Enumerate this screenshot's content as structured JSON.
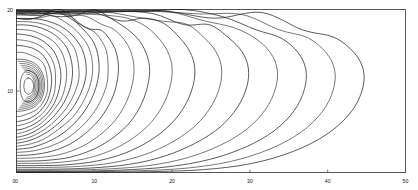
{
  "figure": {
    "title": "",
    "background_color": "#ffffff",
    "line_color": "#1c1c1c",
    "frame_color": "#4d4d4d"
  },
  "axes": {
    "x": {
      "label": "",
      "min": 0,
      "max": 50,
      "ticks": [
        0,
        10,
        20,
        30,
        40,
        50
      ],
      "tick_labels": [
        "0",
        "10",
        "20",
        "30",
        "40",
        "50"
      ]
    },
    "y": {
      "label": "",
      "min": 0,
      "max": 20,
      "ticks": [
        0,
        10,
        20
      ],
      "tick_labels": [
        "0",
        "10",
        "20"
      ]
    }
  },
  "chart_data": {
    "type": "line",
    "subtype": "contour",
    "title": "",
    "xlabel": "",
    "ylabel": "",
    "xlim": [
      0,
      50
    ],
    "ylim": [
      0,
      20
    ],
    "grid": false,
    "legend": "none",
    "n_levels": 14,
    "level_labels": [
      "1",
      "2",
      "3",
      "4",
      "5",
      "6",
      "7",
      "8",
      "9",
      "10",
      "11",
      "12",
      "13",
      "14"
    ],
    "core_center": {
      "x": 1.8,
      "y": 10.6
    },
    "series": [
      {
        "name": "level-1",
        "closed": true,
        "points": [
          [
            1.5,
            11.6
          ],
          [
            2.0,
            11.3
          ],
          [
            2.2,
            10.6
          ],
          [
            2.0,
            9.9
          ],
          [
            1.5,
            9.6
          ],
          [
            1.1,
            9.9
          ],
          [
            0.95,
            10.6
          ],
          [
            1.1,
            11.3
          ],
          [
            1.5,
            11.6
          ]
        ]
      },
      {
        "name": "level-2",
        "closed": true,
        "points": [
          [
            1.6,
            12.5
          ],
          [
            2.5,
            12.0
          ],
          [
            2.9,
            10.8
          ],
          [
            2.6,
            9.4
          ],
          [
            1.8,
            8.7
          ],
          [
            0.9,
            8.9
          ],
          [
            0.5,
            10.0
          ],
          [
            0.55,
            11.4
          ],
          [
            1.0,
            12.3
          ],
          [
            1.6,
            12.5
          ]
        ]
      },
      {
        "name": "level-3",
        "open_left": true,
        "points": [
          [
            0,
            13.9
          ],
          [
            1.3,
            13.8
          ],
          [
            2.6,
            13.2
          ],
          [
            3.4,
            12.0
          ],
          [
            3.6,
            10.5
          ],
          [
            3.2,
            9.0
          ],
          [
            2.2,
            8.0
          ],
          [
            1.0,
            7.6
          ],
          [
            0,
            7.5
          ]
        ]
      },
      {
        "name": "level-4",
        "open_left": true,
        "points": [
          [
            0,
            15.6
          ],
          [
            1.0,
            15.5
          ],
          [
            2.2,
            15.2
          ],
          [
            3.3,
            14.5
          ],
          [
            4.1,
            13.3
          ],
          [
            4.5,
            11.8
          ],
          [
            4.4,
            10.2
          ],
          [
            3.9,
            8.7
          ],
          [
            2.9,
            7.4
          ],
          [
            1.6,
            6.6
          ],
          [
            0.4,
            6.3
          ],
          [
            0,
            6.25
          ]
        ]
      },
      {
        "name": "level-5",
        "open_left": true,
        "points": [
          [
            0,
            17.0
          ],
          [
            1.1,
            16.9
          ],
          [
            2.4,
            16.6
          ],
          [
            3.6,
            16.0
          ],
          [
            4.7,
            15.0
          ],
          [
            5.4,
            13.6
          ],
          [
            5.7,
            12.0
          ],
          [
            5.5,
            10.3
          ],
          [
            4.9,
            8.6
          ],
          [
            3.8,
            7.1
          ],
          [
            2.4,
            6.0
          ],
          [
            1.0,
            5.4
          ],
          [
            0,
            5.2
          ]
        ]
      },
      {
        "name": "level-6",
        "open_left": true,
        "points": [
          [
            0,
            18.1
          ],
          [
            1.2,
            18.1
          ],
          [
            2.6,
            17.9
          ],
          [
            4.0,
            17.4
          ],
          [
            5.3,
            16.6
          ],
          [
            6.4,
            15.4
          ],
          [
            7.0,
            13.9
          ],
          [
            7.2,
            12.2
          ],
          [
            6.9,
            10.4
          ],
          [
            6.1,
            8.6
          ],
          [
            4.9,
            7.0
          ],
          [
            3.4,
            5.7
          ],
          [
            1.8,
            4.8
          ],
          [
            0.5,
            4.4
          ],
          [
            0,
            4.35
          ]
        ]
      },
      {
        "name": "level-7",
        "open_left": true,
        "points": [
          [
            0,
            18.9
          ],
          [
            1.4,
            18.9
          ],
          [
            3.0,
            18.8
          ],
          [
            4.6,
            18.4
          ],
          [
            6.1,
            17.7
          ],
          [
            7.4,
            16.6
          ],
          [
            8.4,
            15.2
          ],
          [
            8.9,
            13.5
          ],
          [
            8.9,
            11.7
          ],
          [
            8.3,
            9.8
          ],
          [
            7.2,
            7.9
          ],
          [
            5.7,
            6.3
          ],
          [
            4.0,
            5.0
          ],
          [
            2.2,
            4.1
          ],
          [
            0.7,
            3.7
          ],
          [
            0,
            3.6
          ]
        ]
      },
      {
        "name": "level-8",
        "open_left": true,
        "wavy_top": true,
        "points": [
          [
            0,
            19.4
          ],
          [
            1.6,
            19.4
          ],
          [
            3.3,
            19.4
          ],
          [
            5.0,
            19.2
          ],
          [
            6.5,
            18.8
          ],
          [
            7.9,
            18.1
          ],
          [
            9.1,
            17.1
          ],
          [
            10.0,
            15.8
          ],
          [
            10.5,
            14.2
          ],
          [
            10.6,
            12.4
          ],
          [
            10.2,
            10.4
          ],
          [
            9.3,
            8.4
          ],
          [
            7.9,
            6.5
          ],
          [
            6.1,
            4.9
          ],
          [
            4.1,
            3.8
          ],
          [
            2.1,
            3.1
          ],
          [
            0.6,
            2.9
          ],
          [
            0,
            2.85
          ]
        ]
      },
      {
        "name": "level-9",
        "open_left": true,
        "wavy_top": true,
        "points": [
          [
            0,
            19.6
          ],
          [
            2.0,
            19.65
          ],
          [
            4.0,
            19.6
          ],
          [
            6.0,
            19.4
          ],
          [
            7.8,
            19.0
          ],
          [
            9.4,
            18.4
          ],
          [
            10.9,
            17.5
          ],
          [
            12.0,
            16.3
          ],
          [
            12.8,
            14.8
          ],
          [
            13.1,
            13.0
          ],
          [
            12.9,
            11.0
          ],
          [
            12.2,
            8.9
          ],
          [
            10.9,
            6.8
          ],
          [
            9.1,
            5.0
          ],
          [
            6.9,
            3.5
          ],
          [
            4.5,
            2.6
          ],
          [
            2.2,
            2.2
          ],
          [
            0.5,
            2.1
          ],
          [
            0,
            2.1
          ]
        ]
      },
      {
        "name": "level-10",
        "open_left": true,
        "wavy_top": true,
        "points": [
          [
            0,
            19.8
          ],
          [
            2.5,
            19.85
          ],
          [
            5.0,
            19.8
          ],
          [
            7.5,
            19.6
          ],
          [
            10.0,
            19.2
          ],
          [
            12.2,
            18.6
          ],
          [
            14.1,
            17.7
          ],
          [
            15.6,
            16.4
          ],
          [
            16.6,
            14.8
          ],
          [
            17.1,
            12.9
          ],
          [
            16.9,
            10.8
          ],
          [
            16.1,
            8.5
          ],
          [
            14.7,
            6.3
          ],
          [
            12.6,
            4.4
          ],
          [
            10.0,
            2.9
          ],
          [
            7.0,
            1.9
          ],
          [
            4.0,
            1.5
          ],
          [
            1.5,
            1.4
          ],
          [
            0,
            1.4
          ]
        ]
      },
      {
        "name": "level-11",
        "open_left": true,
        "wavy_top": true,
        "points": [
          [
            0,
            19.9
          ],
          [
            3.0,
            19.95
          ],
          [
            6.5,
            19.9
          ],
          [
            10.0,
            19.7
          ],
          [
            13.5,
            19.3
          ],
          [
            16.5,
            18.7
          ],
          [
            19.0,
            17.8
          ],
          [
            21.0,
            16.5
          ],
          [
            22.3,
            14.8
          ],
          [
            22.9,
            12.9
          ],
          [
            22.7,
            10.7
          ],
          [
            21.7,
            8.3
          ],
          [
            19.9,
            6.0
          ],
          [
            17.3,
            4.0
          ],
          [
            14.0,
            2.4
          ],
          [
            10.3,
            1.4
          ],
          [
            6.5,
            0.95
          ],
          [
            3.0,
            0.85
          ],
          [
            0,
            0.85
          ]
        ]
      },
      {
        "name": "level-12",
        "open_left": true,
        "wavy_top": true,
        "points": [
          [
            0,
            19.95
          ],
          [
            4.0,
            20.0
          ],
          [
            8.5,
            19.95
          ],
          [
            13.0,
            19.8
          ],
          [
            17.5,
            19.4
          ],
          [
            21.5,
            18.8
          ],
          [
            24.8,
            17.9
          ],
          [
            27.3,
            16.5
          ],
          [
            29.0,
            14.8
          ],
          [
            29.8,
            12.8
          ],
          [
            29.6,
            10.5
          ],
          [
            28.4,
            8.0
          ],
          [
            26.2,
            5.6
          ],
          [
            23.0,
            3.6
          ],
          [
            19.0,
            2.0
          ],
          [
            14.5,
            1.0
          ],
          [
            9.5,
            0.55
          ],
          [
            4.5,
            0.4
          ],
          [
            0,
            0.4
          ]
        ]
      },
      {
        "name": "level-13",
        "open_left": true,
        "wavy_top": true,
        "points": [
          [
            0,
            20.0
          ],
          [
            5.0,
            20.0
          ],
          [
            10.5,
            20.0
          ],
          [
            16.0,
            19.85
          ],
          [
            21.5,
            19.5
          ],
          [
            26.5,
            18.9
          ],
          [
            30.8,
            17.9
          ],
          [
            34.0,
            16.5
          ],
          [
            36.2,
            14.7
          ],
          [
            37.2,
            12.6
          ],
          [
            37.0,
            10.2
          ],
          [
            35.7,
            7.6
          ],
          [
            33.1,
            5.1
          ],
          [
            29.4,
            3.1
          ],
          [
            24.8,
            1.6
          ],
          [
            19.5,
            0.7
          ],
          [
            13.5,
            0.3
          ],
          [
            7.0,
            0.15
          ],
          [
            0,
            0.12
          ]
        ]
      },
      {
        "name": "level-14",
        "open_left": true,
        "wavy_top": true,
        "points": [
          [
            0,
            20.0
          ],
          [
            6.0,
            20.0
          ],
          [
            12.5,
            20.0
          ],
          [
            19.0,
            19.9
          ],
          [
            25.5,
            19.6
          ],
          [
            31.5,
            19.0
          ],
          [
            36.8,
            18.0
          ],
          [
            40.8,
            16.6
          ],
          [
            43.4,
            14.7
          ],
          [
            44.6,
            12.5
          ],
          [
            44.4,
            10.0
          ],
          [
            42.9,
            7.3
          ],
          [
            39.9,
            4.7
          ],
          [
            35.6,
            2.6
          ],
          [
            30.2,
            1.1
          ],
          [
            24.0,
            0.35
          ],
          [
            17.0,
            0.1
          ],
          [
            8.5,
            0.02
          ],
          [
            0,
            0.0
          ]
        ]
      }
    ]
  }
}
